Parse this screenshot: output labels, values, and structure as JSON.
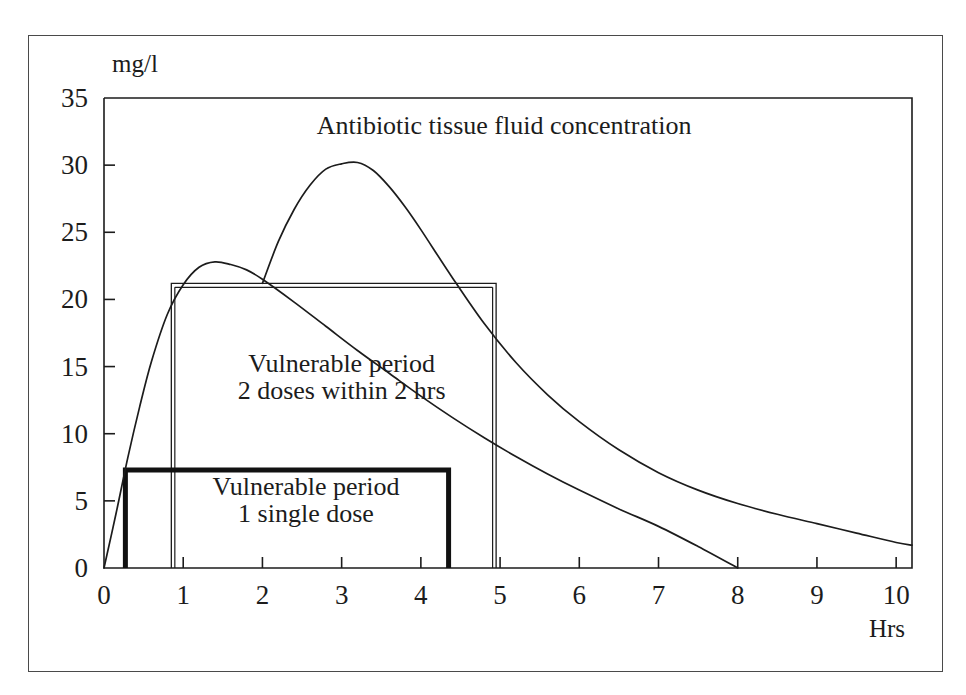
{
  "figure": {
    "frame": {
      "border_color": "#4a4a4a"
    },
    "background": "#ffffff",
    "ink_color": "#1c1c1c"
  },
  "chart_data": {
    "type": "line",
    "title": "Antibiotic tissue fluid concentration",
    "xlabel": "Hrs",
    "ylabel": "mg/l",
    "xlim": [
      0,
      10.2
    ],
    "ylim": [
      0,
      35
    ],
    "grid": false,
    "legend": "none",
    "xticks": [
      0,
      1,
      2,
      3,
      4,
      5,
      6,
      7,
      8,
      9,
      10
    ],
    "xtick_labels": [
      "0",
      "1",
      "2",
      "3",
      "4",
      "5",
      "6",
      "7",
      "8",
      "9",
      "10"
    ],
    "yticks": [
      0,
      5,
      10,
      15,
      20,
      25,
      30,
      35
    ],
    "ytick_labels": [
      "0",
      "5",
      "10",
      "15",
      "20",
      "25",
      "30",
      "35"
    ],
    "series": [
      {
        "name": "single dose concentration",
        "style": "solid-thin",
        "x": [
          0.0,
          0.15,
          0.3,
          0.45,
          0.6,
          0.8,
          1.0,
          1.2,
          1.4,
          1.6,
          1.8,
          2.0,
          2.4,
          2.8,
          3.2,
          3.6,
          4.0,
          4.4,
          4.8,
          5.2,
          5.6,
          6.0,
          6.5,
          7.0,
          7.5,
          8.0
        ],
        "y": [
          0.0,
          4.0,
          8.2,
          12.0,
          15.4,
          18.9,
          21.1,
          22.4,
          22.8,
          22.6,
          22.2,
          21.5,
          19.8,
          18.0,
          16.2,
          14.5,
          12.8,
          11.2,
          9.7,
          8.3,
          7.0,
          5.8,
          4.4,
          3.1,
          1.6,
          0.0
        ]
      },
      {
        "name": "second dose concentration",
        "style": "solid-thin",
        "x": [
          2.0,
          2.2,
          2.4,
          2.6,
          2.8,
          3.0,
          3.2,
          3.4,
          3.6,
          3.8,
          4.0,
          4.4,
          4.8,
          5.2,
          5.6,
          6.0,
          6.5,
          7.0,
          7.5,
          8.0,
          8.5,
          9.0,
          9.5,
          10.0,
          10.2
        ],
        "y": [
          21.2,
          24.3,
          26.7,
          28.5,
          29.7,
          30.1,
          30.2,
          29.6,
          28.4,
          26.9,
          25.2,
          21.6,
          18.2,
          15.3,
          12.9,
          10.9,
          8.8,
          7.1,
          5.8,
          4.8,
          4.0,
          3.3,
          2.6,
          1.9,
          1.7
        ]
      }
    ],
    "annotations": [
      {
        "id": "curve-title",
        "text": "Antibiotic tissue fluid concentration",
        "x": 5.05,
        "y": 32.3,
        "anchor": "middle"
      },
      {
        "id": "vulnerable-two-doses-line1",
        "text": "Vulnerable   period",
        "x": 3.0,
        "y": 14.6,
        "anchor": "middle"
      },
      {
        "id": "vulnerable-two-doses-line2",
        "text": "2 doses within   2 hrs",
        "x": 3.0,
        "y": 12.6,
        "anchor": "middle"
      },
      {
        "id": "vulnerable-single-dose-line1",
        "text": "Vulnerable period",
        "x": 2.55,
        "y": 5.4,
        "anchor": "middle"
      },
      {
        "id": "vulnerable-single-dose-line2",
        "text": "1 single dose",
        "x": 2.55,
        "y": 3.4,
        "anchor": "middle"
      }
    ],
    "regions": [
      {
        "id": "vulnerable-period-two-doses",
        "label": "Vulnerable period 2 doses within 2 hrs",
        "x0": 0.85,
        "x1": 4.95,
        "y_level": 21.2,
        "style": "thin-outline",
        "stroke": "#1c1c1c",
        "stroke_width": 1.3
      },
      {
        "id": "vulnerable-period-single-dose",
        "label": "Vulnerable period 1 single dose",
        "x0": 0.27,
        "x1": 4.35,
        "y_level": 7.3,
        "style": "thick-outline",
        "stroke": "#111111",
        "stroke_width": 5.0
      }
    ]
  }
}
